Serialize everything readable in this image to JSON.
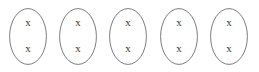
{
  "diagram": {
    "background_color": "#ffffff",
    "oval": {
      "stroke_color": "#6e6e6e",
      "stroke_width": 0.9,
      "fill": "none",
      "width": 38,
      "height": 57,
      "icon_name": "ellipse-outline"
    },
    "mark": {
      "symbol": "x",
      "color": "#3a3a3a",
      "count_per_group": 2
    },
    "groups": [
      {
        "id": "group-1",
        "label": "Oval 1",
        "x": 9,
        "marks": [
          "x",
          "x"
        ]
      },
      {
        "id": "group-2",
        "label": "Oval 2",
        "x": 59,
        "marks": [
          "x",
          "x"
        ]
      },
      {
        "id": "group-3",
        "label": "Oval 3",
        "x": 109,
        "marks": [
          "x",
          "x"
        ]
      },
      {
        "id": "group-4",
        "label": "Oval 4",
        "x": 160,
        "marks": [
          "x",
          "x"
        ]
      },
      {
        "id": "group-5",
        "label": "Oval 5",
        "x": 210,
        "marks": [
          "x",
          "x"
        ]
      }
    ],
    "totals": {
      "group_count": 5,
      "marks_per_group": 2,
      "total_marks": 10
    }
  }
}
